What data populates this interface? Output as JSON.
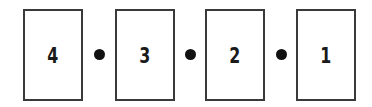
{
  "sequence": {
    "items": [
      {
        "label": "4"
      },
      {
        "label": "3"
      },
      {
        "label": "2"
      },
      {
        "label": "1"
      }
    ],
    "separator": "dot",
    "colors": {
      "border": "#3a3a3a",
      "text": "#1a1a1a",
      "dot": "#111111",
      "background": "#ffffff"
    }
  }
}
